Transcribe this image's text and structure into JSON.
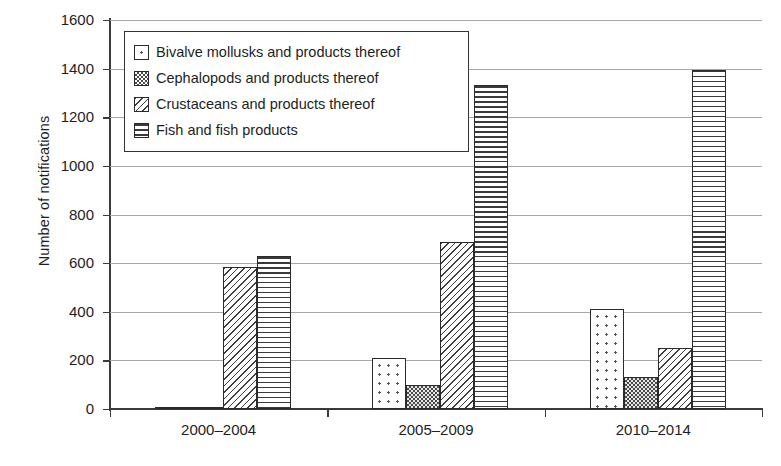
{
  "chart_data": {
    "type": "bar",
    "title": "",
    "xlabel": "",
    "ylabel": "Number of notifications",
    "ylim": [
      0,
      1600
    ],
    "yticks": [
      0,
      200,
      400,
      600,
      800,
      1000,
      1200,
      1400,
      1600
    ],
    "ytick_labels": [
      "0",
      "200",
      "400",
      "600",
      "800",
      "1000",
      "1200",
      "1400",
      "1600"
    ],
    "grid": true,
    "legend_position": "upper left",
    "categories": [
      "2000–2004",
      "2005–2009",
      "2010–2014"
    ],
    "series": [
      {
        "name": "Bivalve mollusks and products thereof",
        "pattern": "sparse-dots",
        "values": [
          3,
          208,
          410
        ]
      },
      {
        "name": "Cephalopods and products thereof",
        "pattern": "fine-checkerboard",
        "values": [
          3,
          100,
          133
        ]
      },
      {
        "name": "Crustaceans and products thereof",
        "pattern": "diagonal-hatch",
        "values": [
          583,
          688,
          250
        ]
      },
      {
        "name": "Fish and fish products",
        "pattern": "horizontal-lines",
        "values": [
          630,
          1333,
          1395
        ]
      }
    ]
  },
  "legend": {
    "items": [
      {
        "label": "Bivalve mollusks and products thereof",
        "icon": "legend-swatch-dots-icon"
      },
      {
        "label": "Cephalopods and products thereof",
        "icon": "legend-swatch-checker-icon"
      },
      {
        "label": "Crustaceans and products thereof",
        "icon": "legend-swatch-diagonal-icon"
      },
      {
        "label": "Fish and fish products",
        "icon": "legend-swatch-horizontal-icon"
      }
    ]
  },
  "colors": {
    "background": "#ffffff",
    "axis": "#3a3a3a",
    "gridline": "#a8a8a8",
    "text": "#1e1e1e",
    "bar_outline": "#2b2b2b"
  }
}
